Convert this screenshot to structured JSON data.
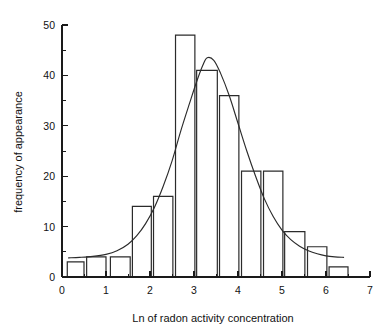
{
  "chart_data": {
    "type": "bar",
    "title": "",
    "subtitle": "",
    "xlabel": "Ln of radon activity concentration",
    "ylabel": "frequency of appearance",
    "xlim": [
      0,
      7
    ],
    "ylim": [
      0,
      50
    ],
    "grid": false,
    "legend": null,
    "x_ticks_major": [
      0,
      1,
      2,
      3,
      4,
      5,
      6,
      7
    ],
    "x_tick_labels": [
      "0",
      "1",
      "2",
      "3",
      "4",
      "5",
      "6",
      "7"
    ],
    "x_ticks_minor": [
      0.5,
      1.5,
      2.5,
      3.5,
      4.5,
      5.5,
      6.5
    ],
    "y_ticks_major": [
      0,
      10,
      20,
      30,
      40,
      50
    ],
    "y_tick_labels": [
      "0",
      "10",
      "20",
      "30",
      "40",
      "50"
    ],
    "y_ticks_minor": [
      5,
      15,
      25,
      35,
      45
    ],
    "bin_width": 0.45,
    "bars": [
      {
        "x_start": 0.12,
        "x_end": 0.5,
        "value": 3
      },
      {
        "x_start": 0.56,
        "x_end": 1.0,
        "value": 4
      },
      {
        "x_start": 1.1,
        "x_end": 1.55,
        "value": 4
      },
      {
        "x_start": 1.6,
        "x_end": 2.03,
        "value": 14
      },
      {
        "x_start": 2.08,
        "x_end": 2.52,
        "value": 16
      },
      {
        "x_start": 2.58,
        "x_end": 3.02,
        "value": 48
      },
      {
        "x_start": 3.06,
        "x_end": 3.53,
        "value": 41
      },
      {
        "x_start": 3.58,
        "x_end": 4.02,
        "value": 36
      },
      {
        "x_start": 4.08,
        "x_end": 4.52,
        "value": 21
      },
      {
        "x_start": 4.58,
        "x_end": 5.02,
        "value": 21
      },
      {
        "x_start": 5.06,
        "x_end": 5.52,
        "value": 9
      },
      {
        "x_start": 5.58,
        "x_end": 6.02,
        "value": 6
      },
      {
        "x_start": 6.07,
        "x_end": 6.5,
        "value": 2
      }
    ],
    "categories": [
      "0.1-0.5",
      "0.6-1.0",
      "1.1-1.6",
      "1.6-2.0",
      "2.1-2.5",
      "2.6-3.0",
      "3.1-3.5",
      "3.6-4.0",
      "4.1-4.5",
      "4.6-5.0",
      "5.1-5.5",
      "5.6-6.0",
      "6.1-6.5"
    ],
    "values": [
      3,
      4,
      4,
      14,
      16,
      48,
      41,
      36,
      21,
      21,
      9,
      6,
      2
    ],
    "overlay_curve": {
      "name": "fitted distribution",
      "type": "line",
      "peak_x": 3.3,
      "peak_y": 43.5,
      "x_start": 0.15,
      "x_end": 6.4,
      "points": [
        [
          0.15,
          3.8
        ],
        [
          0.4,
          3.9
        ],
        [
          0.7,
          4.1
        ],
        [
          1.0,
          4.5
        ],
        [
          1.25,
          5.2
        ],
        [
          1.5,
          6.5
        ],
        [
          1.7,
          8.2
        ],
        [
          1.9,
          10.6
        ],
        [
          2.1,
          13.8
        ],
        [
          2.3,
          18.0
        ],
        [
          2.5,
          23.0
        ],
        [
          2.7,
          29.0
        ],
        [
          2.9,
          34.5
        ],
        [
          3.05,
          38.5
        ],
        [
          3.2,
          42.0
        ],
        [
          3.3,
          43.5
        ],
        [
          3.45,
          43.0
        ],
        [
          3.6,
          40.5
        ],
        [
          3.8,
          36.0
        ],
        [
          4.0,
          30.5
        ],
        [
          4.2,
          25.0
        ],
        [
          4.4,
          20.0
        ],
        [
          4.6,
          15.5
        ],
        [
          4.8,
          12.0
        ],
        [
          5.0,
          9.3
        ],
        [
          5.2,
          7.4
        ],
        [
          5.4,
          6.1
        ],
        [
          5.6,
          5.2
        ],
        [
          5.8,
          4.6
        ],
        [
          6.0,
          4.2
        ],
        [
          6.2,
          4.0
        ],
        [
          6.4,
          3.9
        ]
      ]
    }
  },
  "axes": {
    "x_title": "Ln of radon activity concentration",
    "y_title": "frequency of appearance"
  },
  "colors": {
    "bar_stroke": "#2b2b2b",
    "curve_stroke": "#2b2b2b",
    "axis": "#1a1a1a",
    "text": "#111111",
    "background": "#ffffff"
  }
}
